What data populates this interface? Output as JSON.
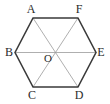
{
  "figure": {
    "kind": "regular-hexagon-with-diagonals",
    "background_color": "#ffffff",
    "outline_color": "#3a3a3a",
    "diagonal_color": "#9a9a9a",
    "label_color": "#2b2b2b",
    "outline_width": 1.6,
    "diagonal_width": 0.8,
    "center": {
      "cx": 55.5,
      "cy": 52.5
    },
    "vertices": [
      {
        "id": "A",
        "label": "A",
        "x": 33,
        "y": 18,
        "label_x": 31,
        "label_y": 13,
        "anchor": "middle"
      },
      {
        "id": "F",
        "label": "F",
        "x": 78,
        "y": 18,
        "label_x": 79,
        "label_y": 13,
        "anchor": "middle"
      },
      {
        "id": "E",
        "label": "E",
        "x": 96,
        "y": 52.5,
        "label_x": 101,
        "label_y": 56,
        "anchor": "middle"
      },
      {
        "id": "D",
        "label": "D",
        "x": 78,
        "y": 87,
        "label_x": 79,
        "label_y": 99,
        "anchor": "middle"
      },
      {
        "id": "C",
        "label": "C",
        "x": 33,
        "y": 87,
        "label_x": 32,
        "label_y": 99,
        "anchor": "middle"
      },
      {
        "id": "B",
        "label": "B",
        "x": 15,
        "y": 52.5,
        "label_x": 9,
        "label_y": 56,
        "anchor": "middle"
      }
    ],
    "center_label": {
      "id": "O",
      "label": "O",
      "label_x": 48,
      "label_y": 62,
      "anchor": "middle"
    },
    "outline_points": "33,18 78,18 96,52.5 78,87 33,87 15,52.5",
    "diagonals": [
      {
        "id": "AD",
        "from": "A",
        "to": "D",
        "x1": 33,
        "y1": 18,
        "x2": 78,
        "y2": 87
      },
      {
        "id": "BE",
        "from": "B",
        "to": "E",
        "x1": 15,
        "y1": 52.5,
        "x2": 96,
        "y2": 52.5
      },
      {
        "id": "CF",
        "from": "C",
        "to": "F",
        "x1": 33,
        "y1": 87,
        "x2": 78,
        "y2": 18
      }
    ]
  }
}
